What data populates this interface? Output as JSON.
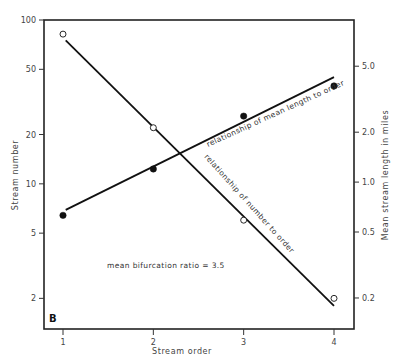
{
  "chart_data": {
    "type": "scatter",
    "panel_label": "B",
    "xlabel": "Stream  order",
    "ylabel_left": "Stream  number",
    "ylabel_right": "Mean  stream  length  in  miles",
    "x_ticks": [
      "1",
      "2",
      "3",
      "4"
    ],
    "xlim": [
      0.8,
      4.25
    ],
    "y_left": {
      "scale": "log",
      "ylim": [
        1.3,
        100
      ],
      "ticks": [
        100,
        50,
        20,
        10,
        5,
        2
      ],
      "tick_labels": [
        "100",
        "50",
        "20",
        "10",
        "5",
        "2"
      ]
    },
    "y_right": {
      "scale": "log",
      "ylim": [
        0.13,
        9.5
      ],
      "ticks": [
        5.0,
        2.0,
        1.0,
        0.5,
        0.2
      ],
      "tick_labels": [
        "5.0",
        "2.0",
        "1.0",
        "0.5",
        "0.2"
      ]
    },
    "series": [
      {
        "name": "Stream number",
        "axis": "left",
        "marker": "open-circle",
        "x": [
          1,
          2,
          3,
          4
        ],
        "values": [
          82,
          22,
          6,
          2
        ],
        "fit_line": {
          "x": [
            1.03,
            4.0
          ],
          "y": [
            75,
            1.8
          ]
        },
        "line_label": "relationship  of  number  to  order"
      },
      {
        "name": "Mean stream length",
        "axis": "right",
        "marker": "filled-circle",
        "x": [
          1,
          2,
          3,
          4
        ],
        "values": [
          0.63,
          1.2,
          2.5,
          3.8
        ],
        "fit_line": {
          "x": [
            1.03,
            4.0
          ],
          "y": [
            0.68,
            4.3
          ]
        },
        "line_label": "relationship  of  mean  length  to  order"
      }
    ],
    "annotations": [
      "mean  bifurcation  ratio  =  3.5"
    ],
    "grid": false,
    "legend": "none"
  }
}
